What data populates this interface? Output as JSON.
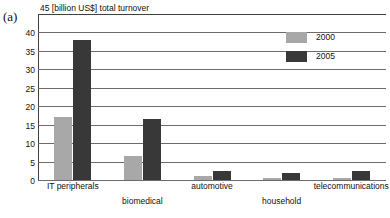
{
  "figure": {
    "label": "(a)"
  },
  "chart_data": {
    "type": "bar",
    "title": "45 [billion US$] total turnover",
    "xlabel": "",
    "ylabel": "[billion US$]",
    "ylim": [
      0,
      45
    ],
    "yticks": [
      0,
      5,
      10,
      15,
      20,
      25,
      30,
      35,
      40,
      45
    ],
    "ytick_labels": [
      "0",
      "5",
      "10",
      "15",
      "20",
      "25",
      "30",
      "35",
      "40",
      "45"
    ],
    "grid": true,
    "legend_position": "upper right",
    "categories": [
      "IT peripherals",
      "biomedical",
      "automotive",
      "household",
      "telecommunications"
    ],
    "series": [
      {
        "name": "2000",
        "color": "#a8a8a8",
        "values": [
          17,
          6.5,
          1.2,
          0.6,
          0.5
        ]
      },
      {
        "name": "2005",
        "color": "#383838",
        "values": [
          38,
          16.5,
          2.5,
          2,
          2.5
        ]
      }
    ]
  }
}
